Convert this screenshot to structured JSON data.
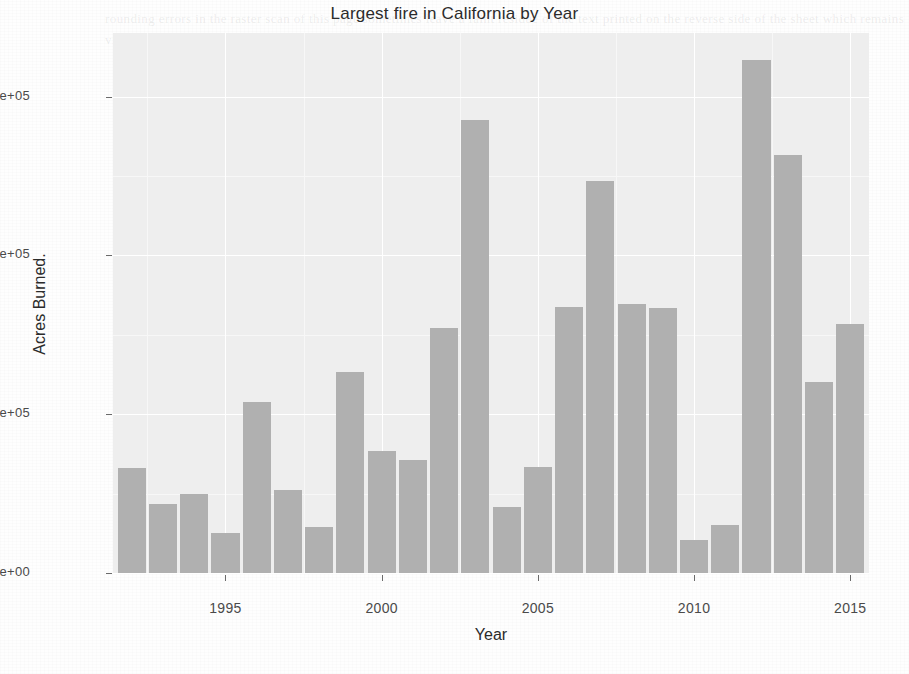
{
  "chart_data": {
    "type": "bar",
    "title": "Largest fire in California by Year",
    "xlabel": "Year",
    "ylabel": "Acres Burned.",
    "categories": [
      1992,
      1993,
      1994,
      1995,
      1996,
      1997,
      1998,
      1999,
      2000,
      2001,
      2002,
      2003,
      2004,
      2005,
      2006,
      2007,
      2008,
      2009,
      2010,
      2011,
      2012,
      2013,
      2014,
      2015
    ],
    "values": [
      66200,
      43500,
      49800,
      25200,
      107800,
      52300,
      29000,
      126700,
      76900,
      71200,
      154400,
      285500,
      41600,
      66800,
      167600,
      247000,
      169500,
      167000,
      20800,
      30300,
      323300,
      263400,
      120000,
      157000
    ],
    "xlim": [
      1991.4,
      2015.6
    ],
    "ylim": [
      0,
      340000
    ],
    "x_ticks": [
      1995,
      2000,
      2005,
      2010,
      2015
    ],
    "x_tick_labels": [
      "1995",
      "2000",
      "2005",
      "2010",
      "2015"
    ],
    "x_minor_ticks": [
      1992.5,
      1997.5,
      2002.5,
      2007.5,
      2012.5
    ],
    "y_ticks": [
      0,
      100000,
      200000,
      300000
    ],
    "y_tick_labels": [
      "0e+00",
      "1e+05",
      "2e+05",
      "3e+05"
    ],
    "y_minor_ticks": [
      50000,
      150000,
      250000
    ],
    "grid": true,
    "legend": null,
    "bar_color": "#b0b0b0",
    "panel_color": "#eeeeee"
  },
  "ghost_text": "rounding errors in the raster scan of this page sometimes leave a faint residue of the text printed on the reverse side of the sheet which remains visible behind the plotted figure"
}
